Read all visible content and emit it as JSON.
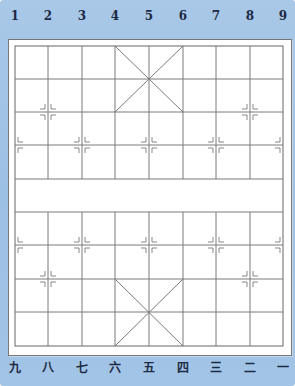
{
  "board": {
    "type": "xiangqi",
    "columns": 9,
    "rows": 10,
    "colors": {
      "background": "#a2c4e6",
      "paper": "#ffffff",
      "line": "#7a7a7a",
      "label": "#1d2a44"
    },
    "top_labels": [
      "1",
      "2",
      "3",
      "4",
      "5",
      "6",
      "7",
      "8",
      "9"
    ],
    "bottom_labels": [
      "九",
      "八",
      "七",
      "六",
      "五",
      "四",
      "三",
      "二",
      "一"
    ],
    "river_text": ""
  }
}
